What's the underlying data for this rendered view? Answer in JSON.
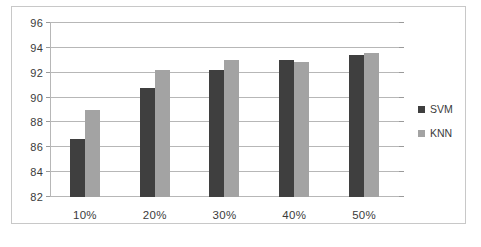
{
  "chart_data": {
    "type": "bar",
    "title": "",
    "xlabel": "",
    "ylabel": "",
    "categories": [
      "10%",
      "20%",
      "30%",
      "40%",
      "50%"
    ],
    "series": [
      {
        "name": "SVM",
        "color": "#3f3f3f",
        "values": [
          86.7,
          90.8,
          92.2,
          93.0,
          93.4
        ]
      },
      {
        "name": "KNN",
        "color": "#a3a3a3",
        "values": [
          89.0,
          92.2,
          93.0,
          92.85,
          93.6
        ]
      }
    ],
    "ylim": [
      82,
      96
    ],
    "yticks": [
      82,
      84,
      86,
      88,
      90,
      92,
      94,
      96
    ],
    "ytick_labels": [
      "82",
      "84",
      "86",
      "88",
      "90",
      "92",
      "94",
      "96"
    ],
    "grid": true,
    "legend_position": "right",
    "legend_entries": [
      "SVM",
      "KNN"
    ]
  },
  "colors": {
    "svm": "#3f3f3f",
    "knn": "#a3a3a3",
    "gridline": "#b7b7b7",
    "frame_border": "#c8c8c8",
    "background": "#ffffff",
    "text": "#3b3b3b"
  }
}
